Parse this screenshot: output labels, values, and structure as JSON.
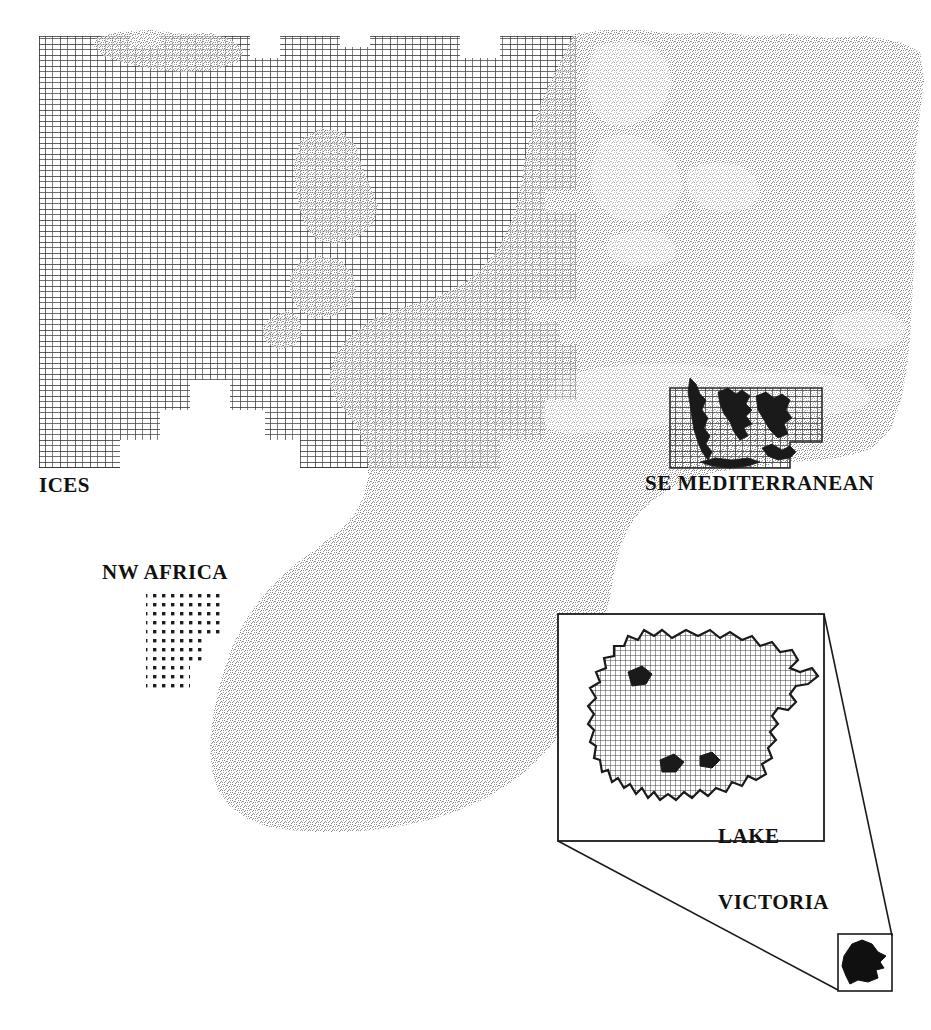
{
  "figure": {
    "width": 931,
    "height": 1030,
    "background_color": "#ffffff",
    "land_fill_color": "#b4b4b4",
    "sea_fill_color": "#ffffff",
    "grid_line_color": "#2a2a2a",
    "coastline_color": "#1a1a1a",
    "label_color": "#111111"
  },
  "labels": {
    "ices": "ICES",
    "se_mediterranean": "SE MEDITERRANEAN",
    "nw_africa": "NW AFRICA",
    "lake_victoria_line1": "LAKE",
    "lake_victoria_line2": "VICTORIA"
  },
  "regions": [
    {
      "id": "ices",
      "label": "ICES",
      "grid_style": "solid-rectangular-cells",
      "cell_width_px": 15,
      "cell_height_px": 11,
      "bounds": {
        "x": 39,
        "y": 36,
        "width": 537,
        "height": 432
      }
    },
    {
      "id": "se-mediterranean",
      "label": "SE MEDITERRANEAN",
      "grid_style": "solid-rectangular-cells",
      "cell_width_px": 15,
      "cell_height_px": 11,
      "bounds": {
        "x": 670,
        "y": 388,
        "width": 152,
        "height": 80
      }
    },
    {
      "id": "nw-africa",
      "label": "NW AFRICA",
      "grid_style": "dotted-cells",
      "cell_width_px": 9,
      "cell_height_px": 9,
      "bounds": {
        "x": 146,
        "y": 590,
        "width": 78,
        "height": 98
      }
    },
    {
      "id": "lake-victoria",
      "label": "LAKE VICTORIA",
      "grid_style": "fine-grid-cells",
      "cell_width_px": 5,
      "cell_height_px": 5,
      "bounds": {
        "x": 558,
        "y": 614,
        "width": 266,
        "height": 227
      }
    }
  ],
  "inset": {
    "id": "lake-victoria-inset",
    "box": {
      "x": 558,
      "y": 614,
      "width": 266,
      "height": 227
    },
    "locator_box": {
      "x": 838,
      "y": 934,
      "width": 54,
      "height": 57
    },
    "connector_lines": 2,
    "border_color": "#1a1a1a"
  },
  "geography": {
    "landmasses": [
      "Iceland",
      "British Isles",
      "Scandinavia",
      "Continental Europe",
      "Russia",
      "Turkey",
      "North Africa",
      "Sub-Saharan Africa"
    ],
    "water_bodies": [
      "North Atlantic Ocean",
      "North Sea",
      "Baltic Sea",
      "Mediterranean Sea",
      "Aegean Sea",
      "Black Sea",
      "Lake Victoria"
    ]
  }
}
